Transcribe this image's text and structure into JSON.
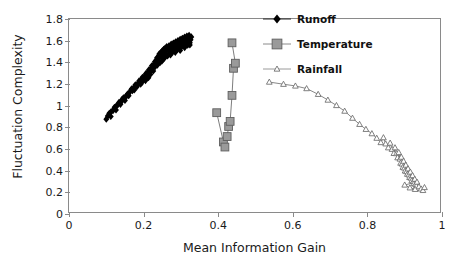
{
  "chart_data": {
    "type": "scatter",
    "title": "",
    "xlabel": "Mean Information Gain",
    "ylabel": "Fluctuation Complexity",
    "xlim": [
      0,
      1
    ],
    "ylim": [
      0,
      1.8
    ],
    "xticks": [
      "0",
      "0.2",
      "0.4",
      "0.6",
      "0.8",
      "1"
    ],
    "xtick_values": [
      0,
      0.2,
      0.4,
      0.6,
      0.8,
      1
    ],
    "yticks": [
      "0",
      "0.2",
      "0.4",
      "0.6",
      "0.8",
      "1",
      "1.2",
      "1.4",
      "1.6",
      "1.8"
    ],
    "ytick_values": [
      0,
      0.2,
      0.4,
      0.6,
      0.8,
      1.0,
      1.2,
      1.4,
      1.6,
      1.8
    ],
    "grid": false,
    "legend_position": "top-right",
    "series": [
      {
        "name": "Runoff",
        "marker": "filled-diamond",
        "color": "#000000",
        "line": false,
        "points": [
          [
            0.1,
            0.875
          ],
          [
            0.104,
            0.905
          ],
          [
            0.108,
            0.93
          ],
          [
            0.112,
            0.9
          ],
          [
            0.118,
            0.955
          ],
          [
            0.122,
            0.985
          ],
          [
            0.126,
            0.96
          ],
          [
            0.13,
            1.005
          ],
          [
            0.134,
            1.03
          ],
          [
            0.138,
            1.012
          ],
          [
            0.142,
            1.055
          ],
          [
            0.146,
            1.072
          ],
          [
            0.15,
            1.048
          ],
          [
            0.154,
            1.088
          ],
          [
            0.158,
            1.11
          ],
          [
            0.16,
            1.092
          ],
          [
            0.164,
            1.13
          ],
          [
            0.168,
            1.155
          ],
          [
            0.17,
            1.138
          ],
          [
            0.174,
            1.168
          ],
          [
            0.178,
            1.192
          ],
          [
            0.182,
            1.175
          ],
          [
            0.185,
            1.205
          ],
          [
            0.188,
            1.228
          ],
          [
            0.19,
            1.21
          ],
          [
            0.194,
            1.24
          ],
          [
            0.197,
            1.262
          ],
          [
            0.2,
            1.245
          ],
          [
            0.203,
            1.272
          ],
          [
            0.206,
            1.295
          ],
          [
            0.208,
            1.252
          ],
          [
            0.211,
            1.305
          ],
          [
            0.214,
            1.33
          ],
          [
            0.217,
            1.312
          ],
          [
            0.22,
            1.345
          ],
          [
            0.222,
            1.368
          ],
          [
            0.225,
            1.352
          ],
          [
            0.228,
            1.382
          ],
          [
            0.23,
            1.405
          ],
          [
            0.232,
            1.39
          ],
          [
            0.234,
            1.42
          ],
          [
            0.236,
            1.442
          ],
          [
            0.238,
            1.428
          ],
          [
            0.24,
            1.455
          ],
          [
            0.242,
            1.478
          ],
          [
            0.244,
            1.462
          ],
          [
            0.246,
            1.49
          ],
          [
            0.248,
            1.448
          ],
          [
            0.25,
            1.505
          ],
          [
            0.252,
            1.48
          ],
          [
            0.254,
            1.52
          ],
          [
            0.256,
            1.498
          ],
          [
            0.258,
            1.532
          ],
          [
            0.26,
            1.512
          ],
          [
            0.262,
            1.545
          ],
          [
            0.264,
            1.46
          ],
          [
            0.266,
            1.525
          ],
          [
            0.268,
            1.552
          ],
          [
            0.27,
            1.5
          ],
          [
            0.272,
            1.538
          ],
          [
            0.274,
            1.568
          ],
          [
            0.276,
            1.515
          ],
          [
            0.278,
            1.548
          ],
          [
            0.28,
            1.578
          ],
          [
            0.282,
            1.528
          ],
          [
            0.284,
            1.56
          ],
          [
            0.286,
            1.59
          ],
          [
            0.288,
            1.54
          ],
          [
            0.29,
            1.572
          ],
          [
            0.292,
            1.6
          ],
          [
            0.294,
            1.552
          ],
          [
            0.296,
            1.582
          ],
          [
            0.298,
            1.612
          ],
          [
            0.3,
            1.562
          ],
          [
            0.302,
            1.595
          ],
          [
            0.304,
            1.622
          ],
          [
            0.306,
            1.575
          ],
          [
            0.308,
            1.605
          ],
          [
            0.31,
            1.632
          ],
          [
            0.312,
            1.585
          ],
          [
            0.314,
            1.615
          ],
          [
            0.316,
            1.642
          ],
          [
            0.318,
            1.598
          ],
          [
            0.32,
            1.625
          ],
          [
            0.322,
            1.65
          ],
          [
            0.324,
            1.56
          ],
          [
            0.326,
            1.608
          ],
          [
            0.328,
            1.635
          ],
          [
            0.218,
            1.288
          ],
          [
            0.226,
            1.32
          ],
          [
            0.244,
            1.398
          ],
          [
            0.256,
            1.44
          ],
          [
            0.272,
            1.468
          ],
          [
            0.285,
            1.492
          ],
          [
            0.298,
            1.51
          ],
          [
            0.31,
            1.536
          ],
          [
            0.318,
            1.558
          ],
          [
            0.324,
            1.58
          ],
          [
            0.175,
            1.145
          ],
          [
            0.192,
            1.198
          ],
          [
            0.205,
            1.232
          ],
          [
            0.213,
            1.258
          ],
          [
            0.231,
            1.36
          ],
          [
            0.249,
            1.412
          ],
          [
            0.261,
            1.472
          ],
          [
            0.277,
            1.496
          ],
          [
            0.291,
            1.52
          ],
          [
            0.303,
            1.548
          ],
          [
            0.113,
            0.945
          ],
          [
            0.127,
            0.998
          ],
          [
            0.141,
            1.04
          ],
          [
            0.155,
            1.098
          ],
          [
            0.167,
            1.148
          ],
          [
            0.181,
            1.185
          ],
          [
            0.196,
            1.218
          ],
          [
            0.209,
            1.285
          ],
          [
            0.221,
            1.338
          ],
          [
            0.237,
            1.375
          ],
          [
            0.253,
            1.43
          ],
          [
            0.265,
            1.466
          ],
          [
            0.281,
            1.502
          ],
          [
            0.295,
            1.542
          ],
          [
            0.307,
            1.568
          ],
          [
            0.321,
            1.612
          ]
        ]
      },
      {
        "name": "Temperature",
        "marker": "filled-square",
        "color": "#9a9a9a",
        "line": true,
        "points": [
          [
            0.396,
            0.935
          ],
          [
            0.414,
            0.665
          ],
          [
            0.418,
            0.618
          ],
          [
            0.424,
            0.715
          ],
          [
            0.428,
            0.808
          ],
          [
            0.432,
            0.855
          ],
          [
            0.437,
            1.095
          ],
          [
            0.441,
            1.345
          ],
          [
            0.446,
            1.392
          ],
          [
            0.437,
            1.58
          ]
        ]
      },
      {
        "name": "Rainfall",
        "marker": "open-triangle",
        "color": "#6a6a6a",
        "line": true,
        "points": [
          [
            0.537,
            1.218
          ],
          [
            0.575,
            1.198
          ],
          [
            0.607,
            1.182
          ],
          [
            0.637,
            1.158
          ],
          [
            0.668,
            1.105
          ],
          [
            0.694,
            1.052
          ],
          [
            0.717,
            1.002
          ],
          [
            0.739,
            0.95
          ],
          [
            0.76,
            0.885
          ],
          [
            0.779,
            0.828
          ],
          [
            0.796,
            0.782
          ],
          [
            0.812,
            0.742
          ],
          [
            0.825,
            0.7
          ],
          [
            0.836,
            0.66
          ],
          [
            0.843,
            0.705
          ],
          [
            0.849,
            0.648
          ],
          [
            0.856,
            0.612
          ],
          [
            0.861,
            0.655
          ],
          [
            0.866,
            0.598
          ],
          [
            0.871,
            0.56
          ],
          [
            0.874,
            0.612
          ],
          [
            0.878,
            0.558
          ],
          [
            0.881,
            0.52
          ],
          [
            0.884,
            0.568
          ],
          [
            0.887,
            0.508
          ],
          [
            0.889,
            0.47
          ],
          [
            0.891,
            0.525
          ],
          [
            0.893,
            0.462
          ],
          [
            0.895,
            0.432
          ],
          [
            0.897,
            0.488
          ],
          [
            0.899,
            0.425
          ],
          [
            0.901,
            0.398
          ],
          [
            0.903,
            0.452
          ],
          [
            0.905,
            0.392
          ],
          [
            0.907,
            0.368
          ],
          [
            0.909,
            0.418
          ],
          [
            0.911,
            0.362
          ],
          [
            0.913,
            0.338
          ],
          [
            0.915,
            0.388
          ],
          [
            0.917,
            0.332
          ],
          [
            0.919,
            0.308
          ],
          [
            0.921,
            0.355
          ],
          [
            0.923,
            0.302
          ],
          [
            0.925,
            0.282
          ],
          [
            0.927,
            0.322
          ],
          [
            0.929,
            0.275
          ],
          [
            0.931,
            0.258
          ],
          [
            0.933,
            0.295
          ],
          [
            0.9,
            0.268
          ],
          [
            0.914,
            0.242
          ],
          [
            0.928,
            0.228
          ],
          [
            0.938,
            0.252
          ],
          [
            0.944,
            0.232
          ],
          [
            0.949,
            0.218
          ],
          [
            0.953,
            0.245
          ]
        ]
      }
    ]
  },
  "legend": {
    "items": [
      {
        "label": "Runoff",
        "marker": "filled-diamond"
      },
      {
        "label": "Temperature",
        "marker": "filled-square"
      },
      {
        "label": "Rainfall",
        "marker": "open-triangle"
      }
    ]
  }
}
